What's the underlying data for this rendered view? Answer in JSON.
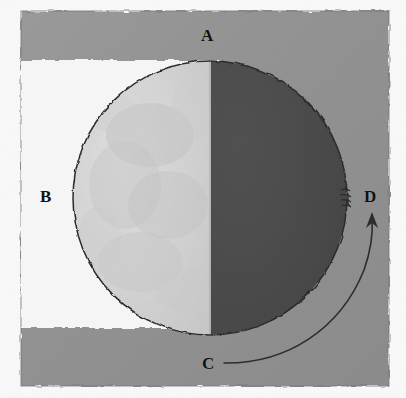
{
  "figure": {
    "caption": "",
    "background_color": "#fefefe",
    "panel_color": "#8c8c8c",
    "white_band_color": "#fbfbfb",
    "moon_lit_color": "#dcdcdc",
    "moon_dark_color": "#3c3c3c",
    "outline_color": "#1a1a1a",
    "label_color": "#111111"
  },
  "labels": [
    {
      "id": "A",
      "text": "A",
      "position": "top",
      "description": "top of diagram, above the moon"
    },
    {
      "id": "B",
      "text": "B",
      "position": "left",
      "description": "left white region beside the lit limb"
    },
    {
      "id": "C",
      "text": "C",
      "position": "bottom",
      "description": "bottom, start of the curved arrow"
    },
    {
      "id": "D",
      "text": "D",
      "position": "right",
      "description": "right edge, tip of the curved arrow"
    }
  ],
  "annotations": {
    "arrow": {
      "name": "curved-arrow-c-to-d",
      "from": "C",
      "to": "D",
      "direction": "counterclockwise sweep from bottom to right",
      "head": "up"
    },
    "edge_mark": {
      "name": "limb-mark",
      "description": "small scribbled mark on the moon's right limb beside D"
    }
  },
  "moon": {
    "phase": "first quarter",
    "lit_side": "left",
    "dark_side": "right",
    "center_x": 210,
    "center_y": 198,
    "radius": 137
  }
}
